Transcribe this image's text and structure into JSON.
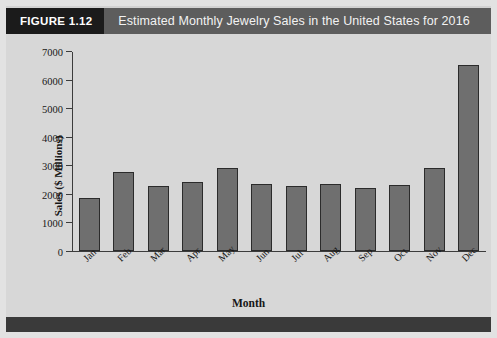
{
  "figure": {
    "tag": "FIGURE 1.12",
    "title": "Estimated Monthly Jewelry Sales in the United States for 2016",
    "tag_bg": "#1b1b1b",
    "banner_bg": "#5d5d5d",
    "panel_bg": "#d7d7d7",
    "bar_fill": "#6f6f6f",
    "bar_stroke": "#2b2b2b"
  },
  "chart_data": {
    "type": "bar",
    "title": "Estimated Monthly Jewelry Sales in the United States for 2016",
    "xlabel": "Month",
    "ylabel": "Sales ($ Millions)",
    "categories": [
      "Jan",
      "Feb",
      "Mar",
      "Apr",
      "May",
      "Jun",
      "Jul",
      "Aug",
      "Sep",
      "Oct",
      "Nov",
      "Dec"
    ],
    "values": [
      1850,
      2780,
      2280,
      2420,
      2930,
      2350,
      2270,
      2350,
      2230,
      2330,
      2930,
      6530
    ],
    "ylim": [
      0,
      7000
    ],
    "yticks": [
      0,
      1000,
      2000,
      3000,
      4000,
      5000,
      6000,
      7000
    ],
    "ytick_labels": [
      "0",
      "1000",
      "2000",
      "3000",
      "4000",
      "5000",
      "6000",
      "7000"
    ],
    "grid": false,
    "legend": null,
    "xtick_rotation": -45
  }
}
